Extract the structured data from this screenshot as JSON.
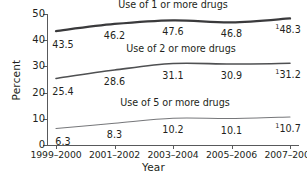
{
  "chart_data": {
    "type": "line",
    "title": "",
    "xlabel": "Year",
    "ylabel": "Percent",
    "categories": [
      "1999–2000",
      "2001–2002",
      "2003–2004",
      "2005–2006",
      "2007–2008"
    ],
    "ylim": [
      0,
      50
    ],
    "yticks": [
      "0",
      "10",
      "20",
      "30",
      "40",
      "50"
    ],
    "grid": false,
    "legend_position": "inline-above-line",
    "footnote_marker": "1",
    "series": [
      {
        "name": "Use of 1 or more drugs",
        "values": [
          43.5,
          46.2,
          47.6,
          46.8,
          48.3
        ],
        "labels": [
          "43.5",
          "46.2",
          "47.6",
          "46.8",
          "48.3"
        ],
        "last_label_superscript": "1",
        "color": "#3a3a3c",
        "line_width": 2.3
      },
      {
        "name": "Use of 2 or more drugs",
        "values": [
          25.4,
          28.6,
          31.1,
          30.9,
          31.2
        ],
        "labels": [
          "25.4",
          "28.6",
          "31.1",
          "30.9",
          "31.2"
        ],
        "last_label_superscript": "1",
        "color": "#4f5052",
        "line_width": 1.6
      },
      {
        "name": "Use of 5 or more drugs",
        "values": [
          6.3,
          8.3,
          10.2,
          10.1,
          10.7
        ],
        "labels": [
          "6.3",
          "8.3",
          "10.2",
          "10.1",
          "10.7"
        ],
        "last_label_superscript": "1",
        "color": "#76777a",
        "line_width": 1.1
      }
    ]
  },
  "axis": {
    "y_title": "Percent",
    "x_title": "Year"
  }
}
